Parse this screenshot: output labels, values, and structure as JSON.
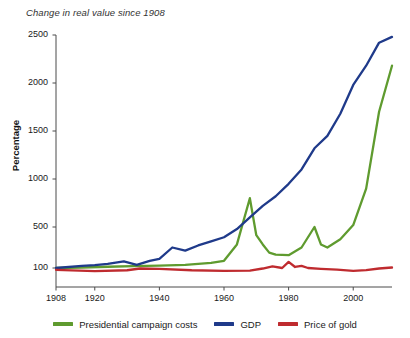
{
  "chart_data": {
    "type": "line",
    "title": "Change in real value since 1908",
    "xlabel": "",
    "ylabel": "Percentage",
    "grid": false,
    "legend_position": "bottom",
    "xlim": [
      1908,
      2012
    ],
    "ylim": [
      60,
      2500
    ],
    "y_axis_note": "non-linear: compressed below 500, linear 500-2500",
    "xticks": [
      1908,
      1920,
      1940,
      1960,
      1980,
      2000
    ],
    "xtick_labels": [
      "1908",
      "1920",
      "1940",
      "1960",
      "1980",
      "2000"
    ],
    "yticks": [
      100,
      500,
      1000,
      1500,
      2000,
      2500
    ],
    "ytick_labels": [
      "100",
      "500",
      "1000",
      "1500",
      "2000",
      "2500"
    ],
    "series": [
      {
        "name": "Presidential campaign costs",
        "color": "#5f9b2f",
        "x": [
          1908,
          1916,
          1924,
          1932,
          1940,
          1948,
          1952,
          1956,
          1960,
          1964,
          1968,
          1970,
          1972,
          1974,
          1976,
          1980,
          1984,
          1988,
          1990,
          1992,
          1996,
          2000,
          2004,
          2008,
          2012
        ],
        "values": [
          100,
          105,
          112,
          118,
          124,
          130,
          140,
          150,
          170,
          330,
          800,
          420,
          330,
          250,
          230,
          225,
          300,
          500,
          330,
          300,
          380,
          520,
          900,
          1700,
          2180
        ]
      },
      {
        "name": "GDP",
        "color": "#1f3a8a",
        "x": [
          1908,
          1916,
          1920,
          1924,
          1929,
          1933,
          1937,
          1940,
          1944,
          1948,
          1952,
          1956,
          1960,
          1964,
          1968,
          1972,
          1976,
          1980,
          1984,
          1988,
          1992,
          1996,
          2000,
          2004,
          2008,
          2012
        ],
        "values": [
          100,
          120,
          128,
          140,
          165,
          130,
          170,
          190,
          300,
          270,
          320,
          360,
          400,
          480,
          600,
          720,
          820,
          950,
          1100,
          1320,
          1450,
          1680,
          1980,
          2180,
          2420,
          2480
        ]
      },
      {
        "name": "Price of gold",
        "color": "#bf2b2f",
        "x": [
          1908,
          1920,
          1930,
          1934,
          1940,
          1950,
          1960,
          1968,
          1972,
          1975,
          1978,
          1980,
          1982,
          1984,
          1986,
          1990,
          1995,
          2000,
          2004,
          2008,
          2012
        ],
        "values": [
          82,
          70,
          78,
          95,
          92,
          78,
          72,
          75,
          95,
          115,
          100,
          160,
          110,
          120,
          100,
          92,
          85,
          72,
          80,
          95,
          105
        ]
      }
    ]
  },
  "legend": {
    "items": [
      {
        "label": "Presidential campaign costs",
        "color": "#5f9b2f"
      },
      {
        "label": "GDP",
        "color": "#1f3a8a"
      },
      {
        "label": "Price of gold",
        "color": "#bf2b2f"
      }
    ]
  }
}
